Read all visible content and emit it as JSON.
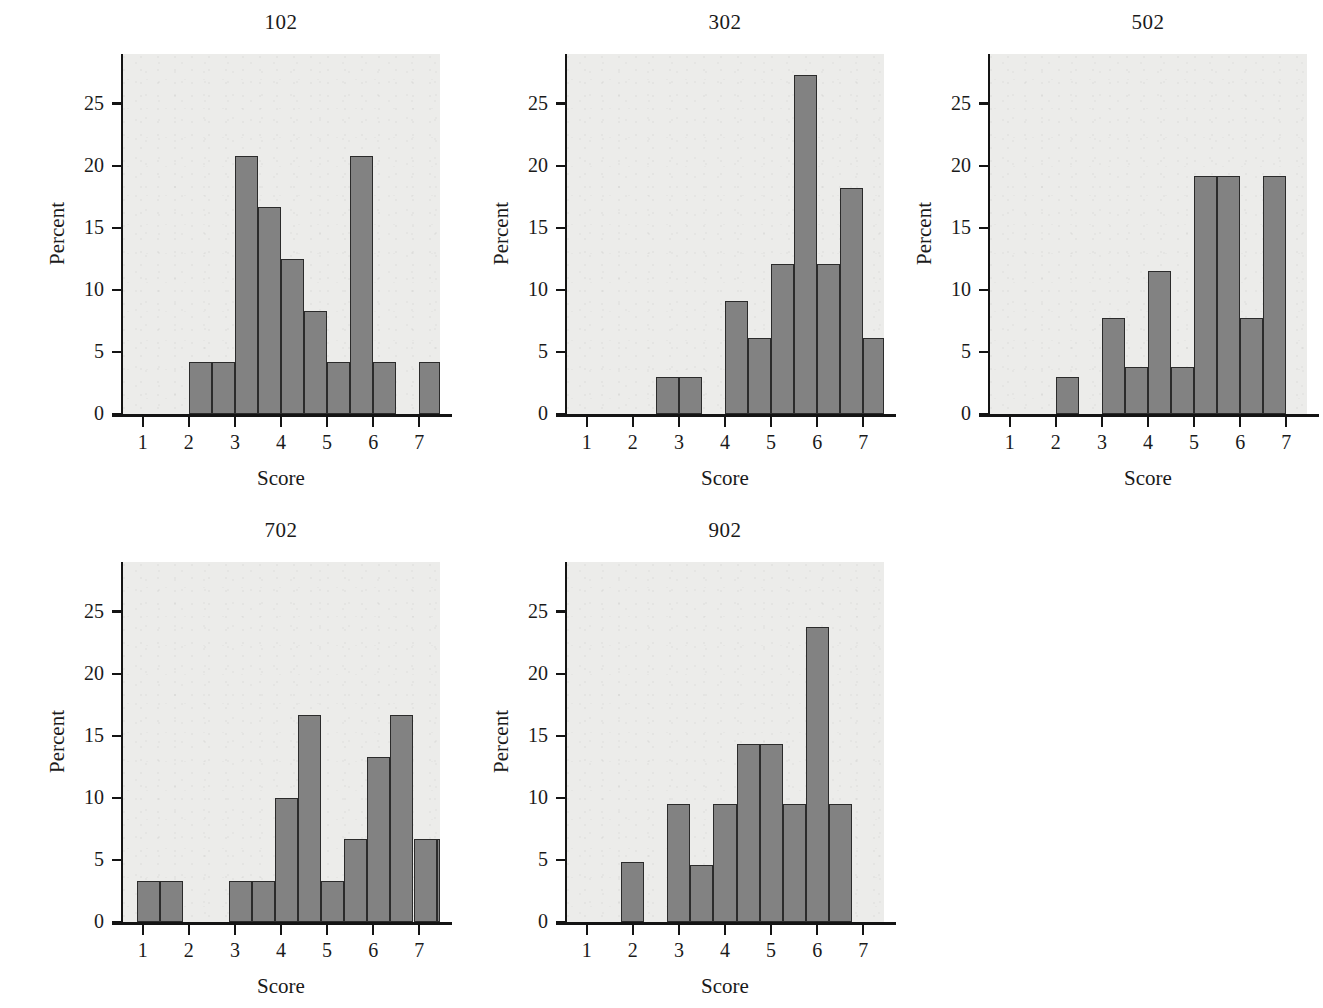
{
  "figure": {
    "background_color": "#ffffff",
    "panel_background_color": "#ececea",
    "bar_fill_color": "#828282",
    "bar_edge_color": "#2b2b2b",
    "axis_color": "#141414"
  },
  "chart_data": [
    {
      "type": "bar",
      "title": "102",
      "xlabel": "Score",
      "ylabel": "Percent",
      "xlim": [
        0.55,
        7.45
      ],
      "ylim": [
        0,
        29
      ],
      "xticks": [
        1,
        2,
        3,
        4,
        5,
        6,
        7
      ],
      "xtick_labels": [
        "1",
        "2",
        "3",
        "4",
        "5",
        "6",
        "7"
      ],
      "yticks": [
        0,
        5,
        10,
        15,
        20,
        25
      ],
      "ytick_labels": [
        "0",
        "5",
        "10",
        "15",
        "20",
        "25"
      ],
      "grid": false,
      "bin_width": 0.5,
      "bins": [
        {
          "x0": 2.0,
          "x1": 2.5,
          "value": 4.2
        },
        {
          "x0": 2.5,
          "x1": 3.0,
          "value": 4.2
        },
        {
          "x0": 3.0,
          "x1": 3.5,
          "value": 20.8
        },
        {
          "x0": 3.5,
          "x1": 4.0,
          "value": 16.7
        },
        {
          "x0": 4.0,
          "x1": 4.5,
          "value": 12.5
        },
        {
          "x0": 4.5,
          "x1": 5.0,
          "value": 8.3
        },
        {
          "x0": 5.0,
          "x1": 5.5,
          "value": 4.2
        },
        {
          "x0": 5.5,
          "x1": 6.0,
          "value": 20.8
        },
        {
          "x0": 6.0,
          "x1": 6.5,
          "value": 4.2
        },
        {
          "x0": 7.0,
          "x1": 7.5,
          "value": 4.2
        }
      ]
    },
    {
      "type": "bar",
      "title": "302",
      "xlabel": "Score",
      "ylabel": "Percent",
      "xlim": [
        0.55,
        7.45
      ],
      "ylim": [
        0,
        29
      ],
      "xticks": [
        1,
        2,
        3,
        4,
        5,
        6,
        7
      ],
      "xtick_labels": [
        "1",
        "2",
        "3",
        "4",
        "5",
        "6",
        "7"
      ],
      "yticks": [
        0,
        5,
        10,
        15,
        20,
        25
      ],
      "ytick_labels": [
        "0",
        "5",
        "10",
        "15",
        "20",
        "25"
      ],
      "grid": false,
      "bin_width": 0.5,
      "bins": [
        {
          "x0": 2.5,
          "x1": 3.0,
          "value": 3.0
        },
        {
          "x0": 3.0,
          "x1": 3.5,
          "value": 3.0
        },
        {
          "x0": 4.0,
          "x1": 4.5,
          "value": 9.1
        },
        {
          "x0": 4.5,
          "x1": 5.0,
          "value": 6.1
        },
        {
          "x0": 5.0,
          "x1": 5.5,
          "value": 12.1
        },
        {
          "x0": 5.5,
          "x1": 6.0,
          "value": 27.3
        },
        {
          "x0": 6.0,
          "x1": 6.5,
          "value": 12.1
        },
        {
          "x0": 6.5,
          "x1": 7.0,
          "value": 18.2
        },
        {
          "x0": 7.0,
          "x1": 7.5,
          "value": 6.1
        },
        {
          "x0": 7.5,
          "x1": 8.0,
          "value": 3.0
        }
      ]
    },
    {
      "type": "bar",
      "title": "502",
      "xlabel": "Score",
      "ylabel": "Percent",
      "xlim": [
        0.55,
        7.45
      ],
      "ylim": [
        0,
        29
      ],
      "xticks": [
        1,
        2,
        3,
        4,
        5,
        6,
        7
      ],
      "xtick_labels": [
        "1",
        "2",
        "3",
        "4",
        "5",
        "6",
        "7"
      ],
      "yticks": [
        0,
        5,
        10,
        15,
        20,
        25
      ],
      "ytick_labels": [
        "0",
        "5",
        "10",
        "15",
        "20",
        "25"
      ],
      "grid": false,
      "bin_width": 0.5,
      "bins": [
        {
          "x0": 2.0,
          "x1": 2.5,
          "value": 3.0
        },
        {
          "x0": 3.0,
          "x1": 3.5,
          "value": 7.7
        },
        {
          "x0": 3.5,
          "x1": 4.0,
          "value": 3.8
        },
        {
          "x0": 4.0,
          "x1": 4.5,
          "value": 11.5
        },
        {
          "x0": 4.5,
          "x1": 5.0,
          "value": 3.8
        },
        {
          "x0": 5.0,
          "x1": 5.5,
          "value": 19.2
        },
        {
          "x0": 5.5,
          "x1": 6.0,
          "value": 19.2
        },
        {
          "x0": 6.0,
          "x1": 6.5,
          "value": 7.7
        },
        {
          "x0": 6.5,
          "x1": 7.0,
          "value": 19.2
        },
        {
          "x0": 7.5,
          "x1": 8.0,
          "value": 3.8
        }
      ]
    },
    {
      "type": "bar",
      "title": "702",
      "xlabel": "Score",
      "ylabel": "Percent",
      "xlim": [
        0.55,
        7.45
      ],
      "ylim": [
        0,
        29
      ],
      "xticks": [
        1,
        2,
        3,
        4,
        5,
        6,
        7
      ],
      "xtick_labels": [
        "1",
        "2",
        "3",
        "4",
        "5",
        "6",
        "7"
      ],
      "yticks": [
        0,
        5,
        10,
        15,
        20,
        25
      ],
      "ytick_labels": [
        "0",
        "5",
        "10",
        "15",
        "20",
        "25"
      ],
      "grid": false,
      "bin_width": 0.5,
      "bins": [
        {
          "x0": 0.875,
          "x1": 1.375,
          "value": 3.3
        },
        {
          "x0": 1.375,
          "x1": 1.875,
          "value": 3.3
        },
        {
          "x0": 2.875,
          "x1": 3.375,
          "value": 3.3
        },
        {
          "x0": 3.375,
          "x1": 3.875,
          "value": 3.3
        },
        {
          "x0": 3.875,
          "x1": 4.375,
          "value": 10.0
        },
        {
          "x0": 4.375,
          "x1": 4.875,
          "value": 16.7
        },
        {
          "x0": 4.875,
          "x1": 5.375,
          "value": 3.3
        },
        {
          "x0": 5.375,
          "x1": 5.875,
          "value": 6.7
        },
        {
          "x0": 5.875,
          "x1": 6.375,
          "value": 13.3
        },
        {
          "x0": 6.375,
          "x1": 6.875,
          "value": 16.7
        },
        {
          "x0": 6.875,
          "x1": 7.375,
          "value": 6.7
        },
        {
          "x0": 7.375,
          "x1": 7.875,
          "value": 6.7
        },
        {
          "x0": 7.875,
          "x1": 8.375,
          "value": 3.3
        },
        {
          "x0": 8.375,
          "x1": 8.875,
          "value": 3.3
        }
      ]
    },
    {
      "type": "bar",
      "title": "902",
      "xlabel": "Score",
      "ylabel": "Percent",
      "xlim": [
        0.55,
        7.45
      ],
      "ylim": [
        0,
        29
      ],
      "xticks": [
        1,
        2,
        3,
        4,
        5,
        6,
        7
      ],
      "xtick_labels": [
        "1",
        "2",
        "3",
        "4",
        "5",
        "6",
        "7"
      ],
      "yticks": [
        0,
        5,
        10,
        15,
        20,
        25
      ],
      "ytick_labels": [
        "0",
        "5",
        "10",
        "15",
        "20",
        "25"
      ],
      "grid": false,
      "bin_width": 0.5,
      "bins": [
        {
          "x0": 1.75,
          "x1": 2.25,
          "value": 4.8
        },
        {
          "x0": 2.75,
          "x1": 3.25,
          "value": 9.5
        },
        {
          "x0": 3.25,
          "x1": 3.75,
          "value": 4.6
        },
        {
          "x0": 3.75,
          "x1": 4.25,
          "value": 9.5
        },
        {
          "x0": 4.25,
          "x1": 4.75,
          "value": 14.3
        },
        {
          "x0": 4.75,
          "x1": 5.25,
          "value": 14.3
        },
        {
          "x0": 5.25,
          "x1": 5.75,
          "value": 9.5
        },
        {
          "x0": 5.75,
          "x1": 6.25,
          "value": 23.8
        },
        {
          "x0": 6.25,
          "x1": 6.75,
          "value": 9.5
        }
      ]
    }
  ],
  "layout": {
    "panels": [
      {
        "left": 18,
        "top": 10,
        "plot_left": 104,
        "plot_top": 44,
        "plot_w": 318,
        "plot_h": 360
      },
      {
        "left": 462,
        "top": 10,
        "plot_left": 104,
        "plot_top": 44,
        "plot_w": 318,
        "plot_h": 360
      },
      {
        "left": 885,
        "top": 10,
        "plot_left": 104,
        "plot_top": 44,
        "plot_w": 318,
        "plot_h": 360
      },
      {
        "left": 18,
        "top": 518,
        "plot_left": 104,
        "plot_top": 44,
        "plot_w": 318,
        "plot_h": 360
      },
      {
        "left": 462,
        "top": 518,
        "plot_left": 104,
        "plot_top": 44,
        "plot_w": 318,
        "plot_h": 360
      }
    ]
  }
}
